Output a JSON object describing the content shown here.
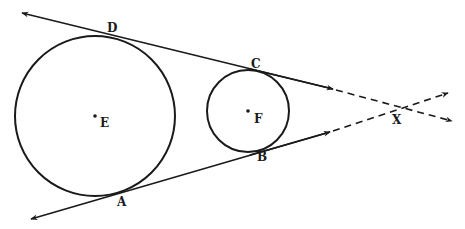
{
  "diagram": {
    "type": "geometry",
    "circles": [
      {
        "center_label": "E",
        "cx": 95,
        "cy": 116,
        "r": 80
      },
      {
        "center_label": "F",
        "cx": 248,
        "cy": 111,
        "r": 41
      }
    ],
    "points": {
      "D": "D",
      "C": "C",
      "B": "B",
      "A": "A",
      "E": "E",
      "F": "F",
      "X": "X"
    },
    "tangent_lines": [
      {
        "name": "DC",
        "through": [
          "D",
          "C",
          "X"
        ]
      },
      {
        "name": "AB",
        "through": [
          "A",
          "B",
          "X"
        ]
      }
    ],
    "colors": {
      "stroke": "#1a1a1a",
      "background": "#ffffff"
    }
  }
}
